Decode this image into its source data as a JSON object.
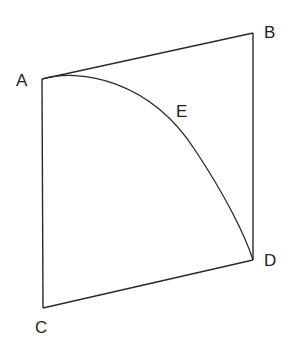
{
  "diagram": {
    "type": "geometry-figure",
    "stroke_color": "#2a2a2a",
    "background": "#ffffff",
    "points": {
      "A": {
        "label": "A",
        "x": 42,
        "y": 79,
        "label_x": 16,
        "label_y": 86
      },
      "B": {
        "label": "B",
        "x": 253,
        "y": 33,
        "label_x": 264,
        "label_y": 38
      },
      "C": {
        "label": "C",
        "x": 43,
        "y": 308,
        "label_x": 35,
        "label_y": 333
      },
      "D": {
        "label": "D",
        "x": 253,
        "y": 260,
        "label_x": 264,
        "label_y": 266
      },
      "E": {
        "label": "E",
        "label_x": 176,
        "label_y": 117
      }
    },
    "segments": [
      {
        "from": "A",
        "to": "B"
      },
      {
        "from": "B",
        "to": "D"
      },
      {
        "from": "D",
        "to": "C"
      },
      {
        "from": "C",
        "to": "A"
      }
    ],
    "arc": {
      "from": "A",
      "to": "D",
      "through_label": "E"
    }
  }
}
